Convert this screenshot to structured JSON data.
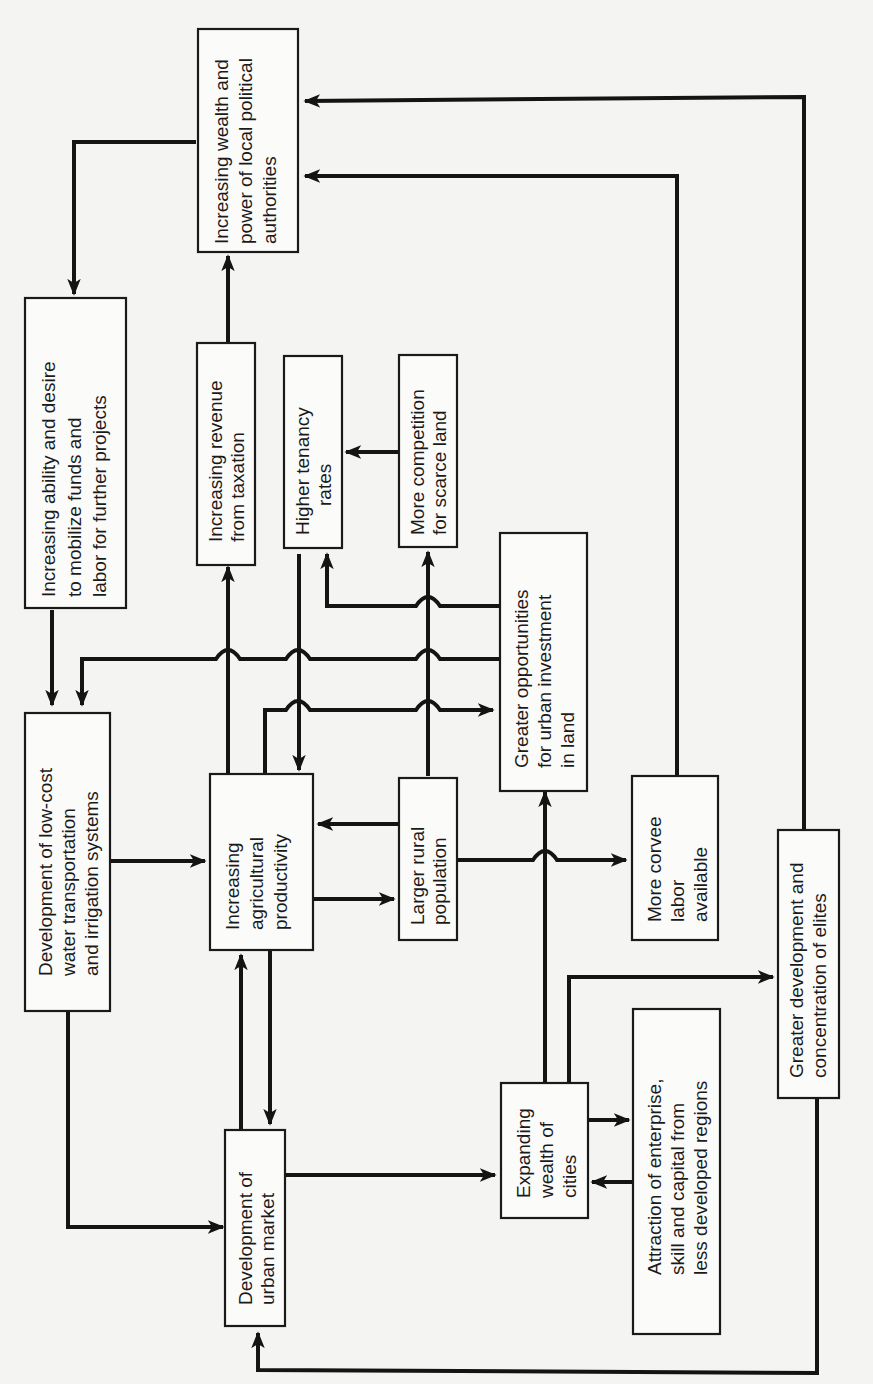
{
  "diagram": {
    "orientation": "rotated 90 degrees counter-clockwise",
    "nodes": [
      {
        "id": "wealth_power",
        "lines": [
          "Increasing wealth and",
          "power of local political",
          "authorities"
        ]
      },
      {
        "id": "ability_desire",
        "lines": [
          "Increasing ability and desire",
          "to mobilize funds and",
          "labor for further projects"
        ]
      },
      {
        "id": "water_transport",
        "lines": [
          "Development of low-cost",
          "water transportation",
          "and irrigation systems"
        ]
      },
      {
        "id": "revenue_tax",
        "lines": [
          "Increasing revenue",
          "from taxation"
        ]
      },
      {
        "id": "tenancy",
        "lines": [
          "Higher tenancy",
          "rates"
        ]
      },
      {
        "id": "competition",
        "lines": [
          "More competition",
          "for scarce land"
        ]
      },
      {
        "id": "urban_investment",
        "lines": [
          "Greater opportunities",
          "for urban investment",
          "in land"
        ]
      },
      {
        "id": "agri_productivity",
        "lines": [
          "Increasing",
          "agricultural",
          "productivity"
        ]
      },
      {
        "id": "rural_population",
        "lines": [
          "Larger rural",
          "population"
        ]
      },
      {
        "id": "corvee",
        "lines": [
          "More corvee",
          "labor",
          "available"
        ]
      },
      {
        "id": "urban_market",
        "lines": [
          "Development of",
          "urban market"
        ]
      },
      {
        "id": "expanding_wealth",
        "lines": [
          "Expanding",
          "wealth of",
          "cities"
        ]
      },
      {
        "id": "attraction",
        "lines": [
          "Attraction of enterprise,",
          "skill and capital from",
          "less developed regions"
        ]
      },
      {
        "id": "elites",
        "lines": [
          "Greater development and",
          "concentration of elites"
        ]
      }
    ],
    "edges": [
      {
        "from": "wealth_power",
        "to": "ability_desire"
      },
      {
        "from": "ability_desire",
        "to": "water_transport"
      },
      {
        "from": "water_transport",
        "to": "agri_productivity"
      },
      {
        "from": "water_transport",
        "to": "urban_market"
      },
      {
        "from": "agri_productivity",
        "to": "revenue_tax"
      },
      {
        "from": "revenue_tax",
        "to": "wealth_power"
      },
      {
        "from": "agri_productivity",
        "to": "rural_population"
      },
      {
        "from": "rural_population",
        "to": "agri_productivity"
      },
      {
        "from": "agri_productivity",
        "to": "urban_market"
      },
      {
        "from": "urban_market",
        "to": "agri_productivity"
      },
      {
        "from": "agri_productivity",
        "to": "urban_investment"
      },
      {
        "from": "tenancy",
        "to": "agri_productivity"
      },
      {
        "from": "competition",
        "to": "tenancy"
      },
      {
        "from": "rural_population",
        "to": "competition"
      },
      {
        "from": "rural_population",
        "to": "corvee"
      },
      {
        "from": "urban_investment",
        "to": "tenancy"
      },
      {
        "from": "urban_investment",
        "to": "water_transport"
      },
      {
        "from": "corvee",
        "to": "wealth_power"
      },
      {
        "from": "urban_market",
        "to": "expanding_wealth"
      },
      {
        "from": "expanding_wealth",
        "to": "urban_investment"
      },
      {
        "from": "expanding_wealth",
        "to": "attraction"
      },
      {
        "from": "attraction",
        "to": "expanding_wealth"
      },
      {
        "from": "expanding_wealth",
        "to": "elites"
      },
      {
        "from": "elites",
        "to": "wealth_power"
      },
      {
        "from": "elites",
        "to": "urban_market"
      }
    ]
  }
}
